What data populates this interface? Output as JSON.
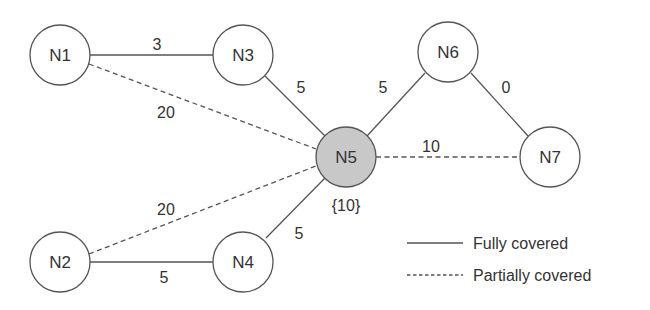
{
  "diagram": {
    "nodes": [
      {
        "id": "N1",
        "label": "N1",
        "cx": 60,
        "cy": 55,
        "highlight": false
      },
      {
        "id": "N3",
        "label": "N3",
        "cx": 243,
        "cy": 55,
        "highlight": false
      },
      {
        "id": "N6",
        "label": "N6",
        "cx": 448,
        "cy": 52,
        "highlight": false
      },
      {
        "id": "N5",
        "label": "N5",
        "cx": 346,
        "cy": 157,
        "highlight": true,
        "annotation": "{10}"
      },
      {
        "id": "N7",
        "label": "N7",
        "cx": 550,
        "cy": 157,
        "highlight": false
      },
      {
        "id": "N2",
        "label": "N2",
        "cx": 60,
        "cy": 262,
        "highlight": false
      },
      {
        "id": "N4",
        "label": "N4",
        "cx": 243,
        "cy": 262,
        "highlight": false
      }
    ],
    "edges": [
      {
        "from": "N1",
        "to": "N3",
        "weight": "3",
        "type": "full"
      },
      {
        "from": "N1",
        "to": "N5",
        "weight": "20",
        "type": "partial"
      },
      {
        "from": "N3",
        "to": "N5",
        "weight": "5",
        "type": "full"
      },
      {
        "from": "N6",
        "to": "N5",
        "weight": "5",
        "type": "full"
      },
      {
        "from": "N6",
        "to": "N7",
        "weight": "0",
        "type": "full"
      },
      {
        "from": "N5",
        "to": "N7",
        "weight": "10",
        "type": "partial"
      },
      {
        "from": "N2",
        "to": "N5",
        "weight": "20",
        "type": "partial"
      },
      {
        "from": "N2",
        "to": "N4",
        "weight": "5",
        "type": "full"
      },
      {
        "from": "N4",
        "to": "N5",
        "weight": "5",
        "type": "full"
      }
    ],
    "legend": {
      "full": "Fully covered",
      "partial": "Partially covered"
    }
  }
}
